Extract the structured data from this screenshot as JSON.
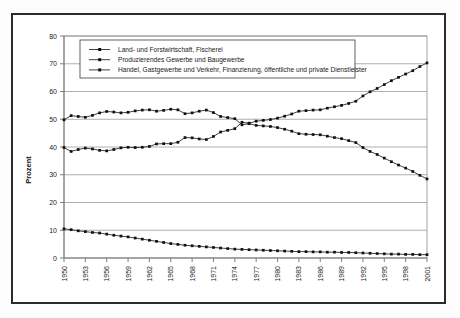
{
  "chart_data": {
    "type": "line",
    "title": "",
    "subtitle": "",
    "xlabel": "",
    "ylabel": "Prozent",
    "ylim": [
      0,
      80
    ],
    "ytick_step": 10,
    "yticks": [
      "0",
      "10",
      "20",
      "30",
      "40",
      "50",
      "60",
      "70",
      "80"
    ],
    "grid": true,
    "legend_position": "top-center-inside",
    "x": [
      1950,
      1951,
      1952,
      1953,
      1954,
      1955,
      1956,
      1957,
      1958,
      1959,
      1960,
      1961,
      1962,
      1963,
      1964,
      1965,
      1966,
      1967,
      1968,
      1969,
      1970,
      1971,
      1972,
      1973,
      1974,
      1975,
      1976,
      1977,
      1978,
      1979,
      1980,
      1981,
      1982,
      1983,
      1984,
      1985,
      1986,
      1987,
      1988,
      1989,
      1990,
      1991,
      1992,
      1993,
      1994,
      1995,
      1996,
      1997,
      1998,
      1999,
      2000,
      2001
    ],
    "xtick_labels": [
      "1950",
      "1953",
      "1956",
      "1959",
      "1962",
      "1965",
      "1968",
      "1971",
      "1974",
      "1977",
      "1980",
      "1983",
      "1986",
      "1989",
      "1992",
      "1995",
      "1998",
      "2001"
    ],
    "xtick_values": [
      1950,
      1953,
      1956,
      1959,
      1962,
      1965,
      1968,
      1971,
      1974,
      1977,
      1980,
      1983,
      1986,
      1989,
      1992,
      1995,
      1998,
      2001
    ],
    "series": [
      {
        "name": "Land- und Forstwirtschaft, Fischerei",
        "marker": "square",
        "color": "#101010",
        "values": [
          10.5,
          10.2,
          9.8,
          9.5,
          9.2,
          9.0,
          8.6,
          8.2,
          7.9,
          7.6,
          7.2,
          6.8,
          6.4,
          6.0,
          5.6,
          5.2,
          4.9,
          4.6,
          4.4,
          4.2,
          4.0,
          3.8,
          3.6,
          3.4,
          3.2,
          3.1,
          3.0,
          2.9,
          2.8,
          2.7,
          2.6,
          2.5,
          2.4,
          2.3,
          2.3,
          2.2,
          2.2,
          2.1,
          2.1,
          2.0,
          2.0,
          1.9,
          1.8,
          1.7,
          1.6,
          1.5,
          1.4,
          1.4,
          1.3,
          1.3,
          1.2,
          1.2
        ]
      },
      {
        "name": "Produzierendes Gewerbe und Baugewerbe",
        "marker": "square",
        "color": "#101010",
        "values": [
          49.8,
          51.3,
          51.0,
          50.7,
          51.4,
          52.3,
          52.8,
          52.6,
          52.3,
          52.5,
          53.0,
          53.3,
          53.4,
          52.9,
          53.2,
          53.6,
          53.4,
          52.0,
          52.3,
          52.9,
          53.3,
          52.4,
          51.0,
          50.6,
          50.2,
          48.0,
          48.4,
          47.8,
          47.6,
          47.4,
          47.0,
          46.4,
          45.7,
          44.8,
          44.6,
          44.5,
          44.4,
          43.9,
          43.4,
          43.0,
          42.3,
          41.6,
          39.8,
          38.4,
          37.3,
          36.0,
          34.7,
          33.5,
          32.4,
          31.2,
          29.8,
          28.5
        ]
      },
      {
        "name": "Handel, Gastgewerbe und Verkehr, Finanzierung, öffentliche und private Dienstleister",
        "marker": "square",
        "color": "#101010",
        "values": [
          39.8,
          38.4,
          39.1,
          39.6,
          39.3,
          38.8,
          38.6,
          39.1,
          39.7,
          39.9,
          39.8,
          39.9,
          40.2,
          41.1,
          41.2,
          41.2,
          41.7,
          43.4,
          43.3,
          42.9,
          42.7,
          43.8,
          45.4,
          46.0,
          46.6,
          48.9,
          48.6,
          49.3,
          49.6,
          49.9,
          50.4,
          51.1,
          51.9,
          52.9,
          53.1,
          53.3,
          53.4,
          54.0,
          54.5,
          55.0,
          55.7,
          56.5,
          58.4,
          59.9,
          61.1,
          62.5,
          63.9,
          65.1,
          66.3,
          67.5,
          69.0,
          70.3
        ]
      }
    ]
  }
}
